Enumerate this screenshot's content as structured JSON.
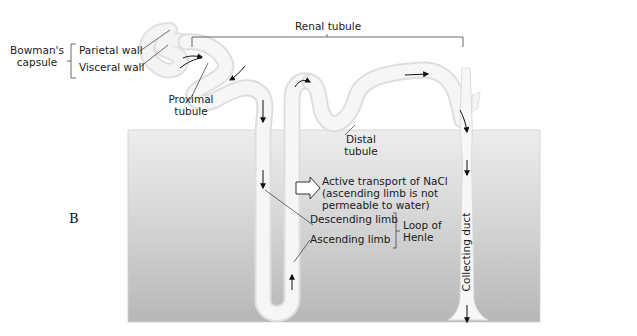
{
  "figure": {
    "panel_letter": "B",
    "colors": {
      "tubule_fill": "#f3f3f3",
      "tubule_edge": "#dcdcdc",
      "medulla_top": "#ececec",
      "medulla_bottom": "#b9b9b9",
      "text": "#1a1a1a",
      "leader_line": "#333333"
    }
  },
  "labels": {
    "bowmans_capsule": [
      "Bowman's",
      "capsule"
    ],
    "parietal_wall": "Parietal wall",
    "visceral_wall": "Visceral wall",
    "proximal_tubule": [
      "Proximal",
      "tubule"
    ],
    "renal_tubule": "Renal tubule",
    "distal_tubule": [
      "Distal",
      "tubule"
    ],
    "active_transport": [
      "Active transport of NaCl",
      "(ascending limb is not",
      "permeable to water)"
    ],
    "descending_limb": "Descending limb",
    "ascending_limb": "Ascending limb",
    "loop_of_henle": [
      "Loop of",
      "Henle"
    ],
    "collecting_duct": "Collecting duct"
  }
}
